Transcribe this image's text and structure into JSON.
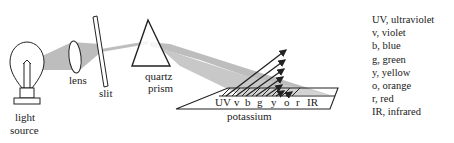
{
  "diagram": {
    "components": {
      "light_source": {
        "label_line1": "light",
        "label_line2": "source"
      },
      "lens": {
        "label": "lens"
      },
      "slit": {
        "label": "slit"
      },
      "prism": {
        "label_line1": "quartz",
        "label_line2": "prism"
      },
      "plate": {
        "label": "potassium"
      }
    },
    "spectrum_labels": [
      "UV",
      "v",
      "b",
      "g",
      "y",
      "o",
      "r",
      "IR"
    ],
    "legend": [
      {
        "abbr": "UV",
        "text": "UV, ultraviolet"
      },
      {
        "abbr": "v",
        "text": "v, violet"
      },
      {
        "abbr": "b",
        "text": "b, blue"
      },
      {
        "abbr": "g",
        "text": "g, green"
      },
      {
        "abbr": "y",
        "text": "y, yellow"
      },
      {
        "abbr": "o",
        "text": "o, orange"
      },
      {
        "abbr": "r",
        "text": "r, red"
      },
      {
        "abbr": "IR",
        "text": "IR, infrared"
      }
    ],
    "colors": {
      "beam": "#bdbdbd",
      "line": "#222222",
      "background": "#ffffff"
    }
  }
}
